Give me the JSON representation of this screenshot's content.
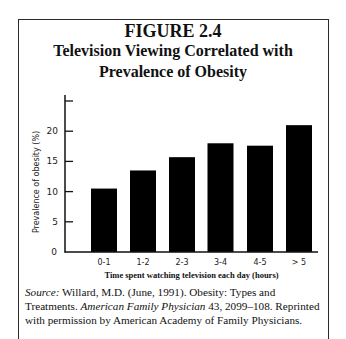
{
  "figure": {
    "label": "FIGURE 2.4",
    "title_line1": "Television Viewing Correlated with",
    "title_line2": "Prevalence of Obesity"
  },
  "source": {
    "label": "Source:",
    "text1": " Willard, M.D. (June, 1991). Obesity: Types and Treatments.",
    "journal": "American Family Physician",
    "text2": " 43, 2099–108. Reprinted with permission by American Academy of Family Physicians."
  },
  "chart_data": {
    "type": "bar",
    "xlabel": "Time spent watching television each day (hours)",
    "ylabel": "Prevalence of obesity (%)",
    "categories": [
      "0-1",
      "1-2",
      "2-3",
      "3-4",
      "4-5",
      "> 5"
    ],
    "values": [
      10.5,
      13.5,
      15.7,
      18.0,
      17.6,
      21.0
    ],
    "ylim": [
      0,
      25
    ],
    "yticks": [
      0,
      5,
      10,
      15,
      20,
      25
    ],
    "ytick_labels": [
      "0",
      "5",
      "10",
      "15",
      "20",
      ""
    ],
    "grid": false,
    "legend": null,
    "bar_color": "#000000"
  }
}
